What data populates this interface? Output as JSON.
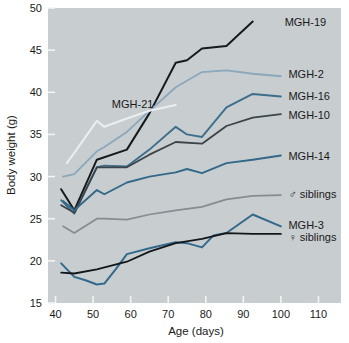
{
  "chart_data": {
    "type": "line",
    "title": "",
    "xlabel": "Age (days)",
    "ylabel": "Body weight (g)",
    "xlim": [
      38,
      116
    ],
    "ylim": [
      15,
      50
    ],
    "xticks": [
      40,
      50,
      60,
      70,
      80,
      90,
      100,
      110
    ],
    "yticks": [
      15,
      20,
      25,
      30,
      35,
      40,
      45,
      50
    ],
    "grid": false,
    "legend_position": "right-inline",
    "plot_background": "#c8cdd0",
    "series": [
      {
        "name": "MGH-19",
        "color": "#161a1c",
        "width": 2.0,
        "label_x": 101,
        "label_y": 48.3,
        "x": [
          41.5,
          45,
          51,
          59,
          65,
          72,
          75,
          79,
          85.5,
          92.5
        ],
        "y": [
          28.5,
          26.0,
          32.0,
          33.2,
          37.5,
          43.5,
          43.8,
          45.2,
          45.5,
          48.4
        ]
      },
      {
        "name": "MGH-2",
        "color": "#8ba7bc",
        "width": 1.8,
        "label_x": 102,
        "label_y": 42.2,
        "x": [
          42,
          45,
          51,
          53,
          59,
          65,
          72,
          79,
          85.5,
          92.5,
          100
        ],
        "y": [
          30.0,
          30.3,
          33.0,
          33.5,
          35.3,
          37.8,
          40.6,
          42.4,
          42.6,
          42.2,
          41.9
        ]
      },
      {
        "name": "MGH-16",
        "color": "#3d6e8c",
        "width": 1.9,
        "label_x": 102,
        "label_y": 39.6,
        "x": [
          41.5,
          45,
          51,
          53,
          59,
          65,
          72,
          75,
          79,
          85.5,
          92.5,
          100
        ],
        "y": [
          27.2,
          25.6,
          31.1,
          31.3,
          31.2,
          33.2,
          35.9,
          35.0,
          34.7,
          38.2,
          39.8,
          39.5
        ]
      },
      {
        "name": "MGH-10",
        "color": "#3b4448",
        "width": 1.8,
        "label_x": 102,
        "label_y": 37.3,
        "x": [
          41.5,
          45,
          51,
          59,
          65,
          72,
          79,
          85.5,
          92.5,
          100
        ],
        "y": [
          26.6,
          25.7,
          31.1,
          31.1,
          32.6,
          34.1,
          33.9,
          36.0,
          37.0,
          37.4
        ]
      },
      {
        "name": "MGH-14",
        "color": "#336889",
        "width": 1.9,
        "label_x": 102,
        "label_y": 32.5,
        "x": [
          42,
          45,
          51,
          53,
          59,
          65,
          72,
          75,
          79,
          85.5,
          92.5,
          100
        ],
        "y": [
          27.1,
          26.0,
          28.4,
          27.9,
          29.3,
          30.0,
          30.5,
          30.9,
          30.4,
          31.6,
          32.0,
          32.5
        ]
      },
      {
        "name": "MGH-21",
        "color": "#e9eef2",
        "width": 2.1,
        "label_x": 55,
        "label_y": 38.6,
        "inline_label": true,
        "x": [
          43,
          45,
          51,
          53,
          59,
          65,
          72
        ],
        "y": [
          31.6,
          32.8,
          36.6,
          35.9,
          36.9,
          37.8,
          38.5
        ]
      },
      {
        "name": "♂ siblings",
        "color": "#868c8f",
        "width": 1.7,
        "label_x": 102,
        "label_y": 27.9,
        "x": [
          42,
          45,
          51,
          53,
          59,
          65,
          72,
          79,
          85.5,
          92.5,
          100
        ],
        "y": [
          24.1,
          23.3,
          25.0,
          25.0,
          24.9,
          25.5,
          26.0,
          26.4,
          27.3,
          27.7,
          27.8
        ]
      },
      {
        "name": "MGH-3",
        "color": "#33698c",
        "width": 2.0,
        "label_x": 102,
        "label_y": 24.2,
        "x": [
          41.5,
          45,
          48,
          51,
          53,
          56,
          59,
          65,
          72,
          75,
          79,
          82,
          85.5,
          92.5,
          100
        ],
        "y": [
          19.7,
          18.1,
          17.7,
          17.2,
          17.3,
          19.0,
          20.8,
          21.5,
          22.2,
          22.1,
          21.6,
          23.0,
          23.3,
          25.5,
          24.1
        ]
      },
      {
        "name": "♀ siblings",
        "color": "#131719",
        "width": 1.8,
        "label_x": 102,
        "label_y": 22.8,
        "x": [
          41.5,
          45,
          51,
          59,
          65,
          72,
          79,
          85.5,
          92.5,
          100
        ],
        "y": [
          18.6,
          18.5,
          19.0,
          19.9,
          21.1,
          22.1,
          22.6,
          23.3,
          23.2,
          23.2
        ]
      }
    ]
  },
  "axes": {
    "x_title": "Age (days)",
    "y_title": "Body weight (g)",
    "x_tick_labels": [
      "40",
      "50",
      "60",
      "70",
      "80",
      "90",
      "100",
      "110"
    ],
    "y_tick_labels": [
      "15",
      "20",
      "25",
      "30",
      "35",
      "40",
      "45",
      "50"
    ]
  },
  "labels": {
    "mgh19": "MGH-19",
    "mgh2": "MGH-2",
    "mgh16": "MGH-16",
    "mgh10": "MGH-10",
    "mgh14": "MGH-14",
    "mgh21": "MGH-21",
    "male_siblings": "♂ siblings",
    "mgh3": "MGH-3",
    "female_siblings": "♀ siblings"
  }
}
